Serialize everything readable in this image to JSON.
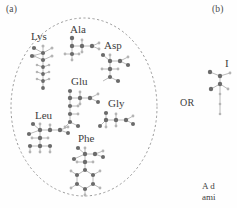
{
  "figure": {
    "panel_a_label": "(a)",
    "panel_b_label": "(b)",
    "or_text": "OR",
    "b_partial_letter": "I",
    "caption_line_1": "A d",
    "caption_line_2": "ami"
  },
  "palette": {
    "atom_dark": "#6b6b6b",
    "atom_light": "#b4b4b4",
    "bond": "#a8a8a8",
    "ellipse_dash": "#9a9a9a",
    "text": "#3d3d3d",
    "background": "#fefefe"
  },
  "amino_acids": [
    {
      "id": "lys",
      "label": "Lys",
      "label_x": 31,
      "label_y": 31,
      "mol_x": 28,
      "mol_y": 44,
      "description": "Lysine with long aliphatic side chain extending downward"
    },
    {
      "id": "ala",
      "label": "Ala",
      "label_x": 70,
      "label_y": 24,
      "mol_x": 62,
      "mol_y": 36,
      "description": "Alanine, smallest chiral amino acid with methyl side chain"
    },
    {
      "id": "asp",
      "label": "Asp",
      "label_x": 104,
      "label_y": 40,
      "mol_x": 98,
      "mol_y": 53,
      "description": "Aspartic acid with carboxylate side chain"
    },
    {
      "id": "glu",
      "label": "Glu",
      "label_x": 71,
      "label_y": 76,
      "mol_x": 64,
      "mol_y": 89,
      "description": "Glutamic acid with longer carboxylate side chain"
    },
    {
      "id": "gly",
      "label": "Gly",
      "label_x": 108,
      "label_y": 98,
      "mol_x": 98,
      "mol_y": 111,
      "description": "Glycine, simplest amino acid with hydrogen side chain"
    },
    {
      "id": "leu",
      "label": "Leu",
      "label_x": 35,
      "label_y": 110,
      "mol_x": 26,
      "mol_y": 122,
      "description": "Leucine with branched isobutyl side chain"
    },
    {
      "id": "phe",
      "label": "Phe",
      "label_x": 78,
      "label_y": 133,
      "mol_x": 71,
      "mol_y": 146,
      "description": "Phenylalanine with aromatic benzene ring side chain"
    }
  ]
}
